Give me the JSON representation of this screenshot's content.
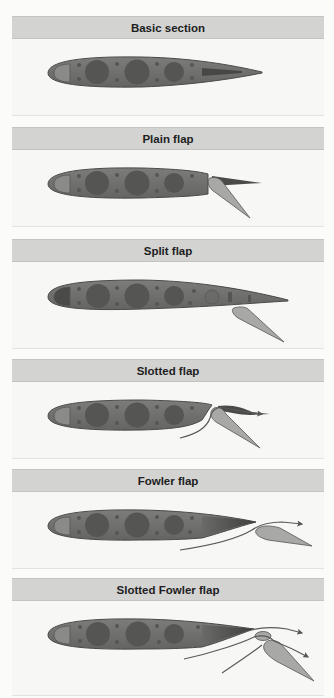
{
  "diagram": {
    "type": "flap-types-comparison",
    "colors": {
      "airfoil_body": "#6f6f6e",
      "airfoil_outline": "#4a4a49",
      "spar_circle": "#4f4f4e",
      "rivet_dot": "#505050",
      "flap_fill": "#a8a8a7",
      "airflow_line": "#5a5a59",
      "header_bg": "#d3d3d2",
      "panel_bg": "#f7f7f6"
    },
    "panels": [
      {
        "title": "Basic section"
      },
      {
        "title": "Plain flap"
      },
      {
        "title": "Split flap"
      },
      {
        "title": "Slotted flap"
      },
      {
        "title": "Fowler flap"
      },
      {
        "title": "Slotted Fowler flap"
      }
    ]
  }
}
